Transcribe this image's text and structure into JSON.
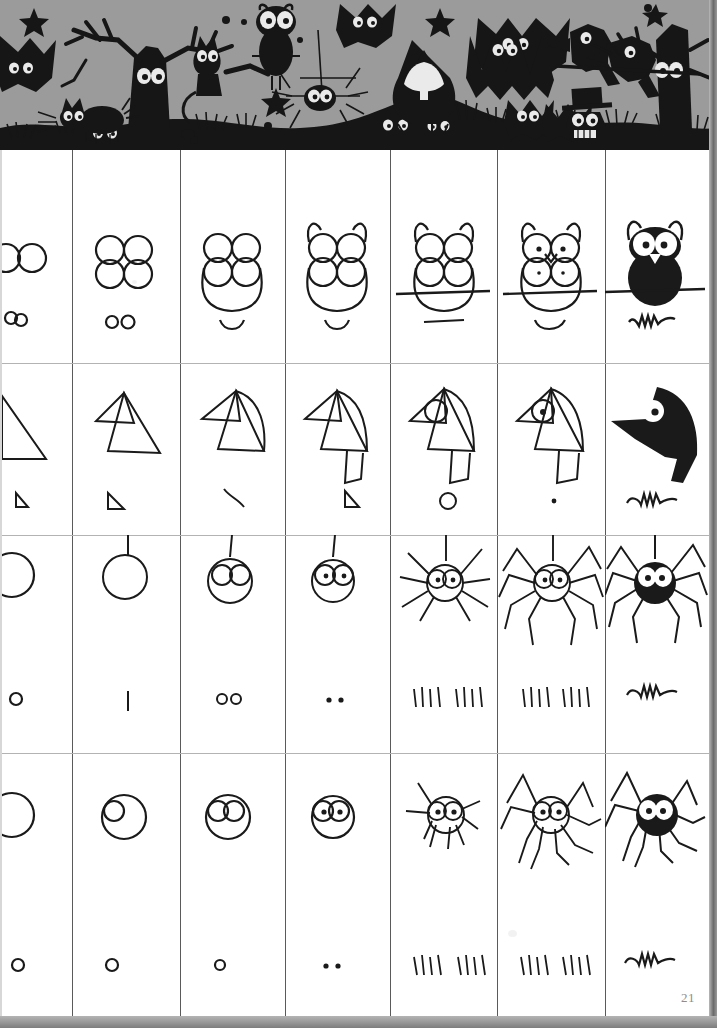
{
  "page": {
    "page_number": "21",
    "background_color": "#ffffff",
    "ink_color": "#1a1a1a",
    "band_background_color": "#9b9b9b",
    "grid_line_color": "#5a5a5a",
    "row_line_color": "#b3b3b3"
  },
  "header_band": {
    "name": "halloween-silhouette-scene",
    "description": "Black silhouette frieze on grey sky: bare trees, cats, owl, bats, spider, ghost in pointed hood, crows on branch, stars, hills with peeping eyes",
    "motifs": [
      "bare-tree-left",
      "bare-tree-right",
      "star",
      "star",
      "star",
      "cat-on-branch",
      "cat-walking",
      "owl",
      "bat",
      "bat",
      "bat",
      "bat",
      "spider-hanging",
      "ghost-hooded",
      "crow",
      "crow",
      "bird-top-hat",
      "pine-tree",
      "pine-tree",
      "hill",
      "hill",
      "grass-tufts",
      "peeping-eyes"
    ]
  },
  "grid": {
    "columns": 7,
    "rows": 4,
    "column_labels": [
      "Step 1",
      "Step 2",
      "Step 3",
      "Step 4",
      "Step 5",
      "Step 6",
      "Step 7"
    ],
    "row_labels": [
      "Owl",
      "Crow",
      "Hanging Spider",
      "Walking Spider"
    ]
  },
  "tutorials": [
    {
      "name": "owl",
      "steps": [
        {
          "step": 1,
          "main": "two-circles-eyes",
          "note": "two small circles side by side"
        },
        {
          "step": 2,
          "main": "four-circles-eyes-stacked",
          "note": "two small circles side by side"
        },
        {
          "step": 3,
          "main": "four-circles-plus-body-oval",
          "note": "smile curve"
        },
        {
          "step": 4,
          "main": "body-with-ear-tufts",
          "note": "smile curve"
        },
        {
          "step": 5,
          "main": "owl-on-branch-line",
          "note": "straight line"
        },
        {
          "step": 6,
          "main": "owl-with-pupils-and-beak",
          "note": "smile curve"
        },
        {
          "step": 7,
          "main": "owl-filled-black-on-branch",
          "note": "squiggle flourish"
        }
      ]
    },
    {
      "name": "crow",
      "steps": [
        {
          "step": 1,
          "main": "right-triangle",
          "note": "tiny triangle"
        },
        {
          "step": 2,
          "main": "two-triangles-head-and-beak",
          "note": "tiny triangle"
        },
        {
          "step": 3,
          "main": "triangles-with-curved-back",
          "note": "small arc"
        },
        {
          "step": 4,
          "main": "body-shape-closed",
          "note": "tiny triangle"
        },
        {
          "step": 5,
          "main": "crow-with-eye-circle-and-tail",
          "note": "small circle"
        },
        {
          "step": 6,
          "main": "crow-with-pupil",
          "note": "dot"
        },
        {
          "step": 7,
          "main": "crow-filled-black",
          "note": "squiggle flourish"
        }
      ]
    },
    {
      "name": "hanging-spider",
      "steps": [
        {
          "step": 1,
          "main": "circle",
          "note": "tiny circle"
        },
        {
          "step": 2,
          "main": "circle-on-thread",
          "note": "short vertical stroke"
        },
        {
          "step": 3,
          "main": "circle-with-two-eyes",
          "note": "two tiny circles"
        },
        {
          "step": 4,
          "main": "eyes-with-pupils",
          "note": "two dots"
        },
        {
          "step": 5,
          "main": "spider-with-first-leg-segments",
          "note": "tally marks 4 and 4"
        },
        {
          "step": 6,
          "main": "spider-with-bent-legs",
          "note": "tally marks 4 and 4"
        },
        {
          "step": 7,
          "main": "spider-filled-black",
          "note": "squiggle flourish"
        }
      ]
    },
    {
      "name": "walking-spider",
      "steps": [
        {
          "step": 1,
          "main": "circle",
          "note": "tiny circle"
        },
        {
          "step": 2,
          "main": "circle-with-small-eye-circle",
          "note": "tiny circle"
        },
        {
          "step": 3,
          "main": "circle-with-two-eyes",
          "note": "tiny circle"
        },
        {
          "step": 4,
          "main": "eyes-with-pupils",
          "note": "two dots"
        },
        {
          "step": 5,
          "main": "spider-with-straight-legs",
          "note": "tally marks 4 and 4"
        },
        {
          "step": 6,
          "main": "spider-with-bent-legs",
          "note": "tally marks 4 and 4"
        },
        {
          "step": 7,
          "main": "spider-filled-black",
          "note": "squiggle flourish"
        }
      ]
    }
  ]
}
